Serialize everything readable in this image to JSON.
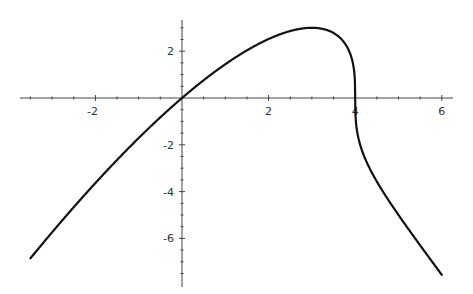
{
  "chart_data": {
    "type": "line",
    "title": "",
    "xlabel": "",
    "ylabel": "",
    "function": "y = x * cbrt(4 - x)",
    "xlim": [
      -3.75,
      6.25
    ],
    "ylim": [
      -7.9,
      3.25
    ],
    "grid": false,
    "legend": null,
    "axes_origin": [
      0,
      0
    ],
    "x_ticks": [
      {
        "value": -2,
        "label": "-2"
      },
      {
        "value": 2,
        "label": "2"
      },
      {
        "value": 4,
        "label": "4"
      },
      {
        "value": 6,
        "label": "6"
      }
    ],
    "y_ticks": [
      {
        "value": 2,
        "label": "2"
      },
      {
        "value": -2,
        "label": "-2"
      },
      {
        "value": -4,
        "label": "-4"
      },
      {
        "value": -6,
        "label": "-6"
      }
    ],
    "series": [
      {
        "name": "curve",
        "color": "#111111",
        "x_range": [
          -3.5,
          6.0
        ],
        "x": [
          -3.5,
          -3,
          -2,
          -1,
          0,
          1,
          2,
          3,
          3.5,
          3.9,
          4,
          4.1,
          4.5,
          5,
          5.5,
          6
        ],
        "y": [
          -6.85,
          -5.74,
          -3.63,
          -1.71,
          0,
          1.44,
          2.52,
          3.0,
          2.78,
          1.81,
          0,
          -1.9,
          -3.57,
          -5.0,
          -6.29,
          -7.56
        ]
      }
    ],
    "annotations": []
  },
  "colors": {
    "background": "#ffffff",
    "axis": "#444444",
    "curve": "#111111"
  }
}
